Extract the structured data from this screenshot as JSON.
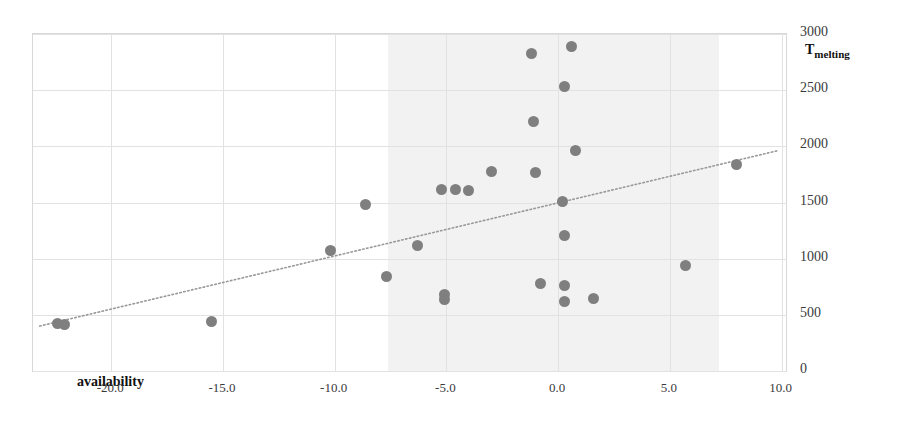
{
  "chart_data": {
    "type": "scatter",
    "title": "",
    "xlabel": "availability",
    "ylabel": "T_melting",
    "ylabel_base": "T",
    "ylabel_sub": "melting",
    "xlim": [
      -23.5,
      10.2
    ],
    "ylim": [
      0,
      3000
    ],
    "xticks": [
      "-20.0",
      "-15.0",
      "-10.0",
      "-5.0",
      "0.0",
      "5.0",
      "10.0"
    ],
    "xtick_values": [
      -20,
      -15,
      -10,
      -5,
      0,
      5,
      10
    ],
    "yticks": [
      "0",
      "500",
      "1000",
      "1500",
      "2000",
      "2500",
      "3000"
    ],
    "ytick_values": [
      0,
      500,
      1000,
      1500,
      2000,
      2500,
      3000
    ],
    "grid": true,
    "legend": "none",
    "y_axis_position": "right",
    "shaded_band": {
      "x_start": -7.6,
      "x_end": 7.2,
      "color": "#f2f2f2"
    },
    "marker_color": "#7f7f7f",
    "trendline": {
      "style": "dotted",
      "color": "#999999",
      "x_start": -23.2,
      "y_start": 400,
      "x_end": 9.8,
      "y_end": 1960
    },
    "points": [
      {
        "x": -22.4,
        "y": 425
      },
      {
        "x": -22.1,
        "y": 410
      },
      {
        "x": -15.5,
        "y": 440
      },
      {
        "x": -10.2,
        "y": 1075
      },
      {
        "x": -8.6,
        "y": 1480
      },
      {
        "x": -7.7,
        "y": 845
      },
      {
        "x": -6.3,
        "y": 1120
      },
      {
        "x": -5.2,
        "y": 1620
      },
      {
        "x": -5.1,
        "y": 680
      },
      {
        "x": -5.1,
        "y": 640
      },
      {
        "x": -4.6,
        "y": 1620
      },
      {
        "x": -4.0,
        "y": 1610
      },
      {
        "x": -3.0,
        "y": 1780
      },
      {
        "x": -1.2,
        "y": 2830
      },
      {
        "x": -1.1,
        "y": 2225
      },
      {
        "x": -1.0,
        "y": 1770
      },
      {
        "x": -0.8,
        "y": 775
      },
      {
        "x": 0.3,
        "y": 2535
      },
      {
        "x": 0.2,
        "y": 1505
      },
      {
        "x": 0.3,
        "y": 1205
      },
      {
        "x": 0.3,
        "y": 765
      },
      {
        "x": 0.3,
        "y": 620
      },
      {
        "x": 0.6,
        "y": 2890
      },
      {
        "x": 0.8,
        "y": 1965
      },
      {
        "x": 1.6,
        "y": 645
      },
      {
        "x": 5.7,
        "y": 935
      },
      {
        "x": 8.0,
        "y": 1835
      }
    ]
  }
}
